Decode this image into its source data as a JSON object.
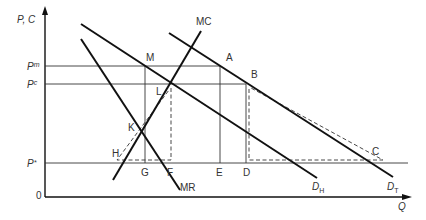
{
  "diagram": {
    "axes": {
      "y_label": "P, C",
      "x_label": "Q",
      "origin": "0"
    },
    "price_levels": [
      {
        "label": "P",
        "sup": "m",
        "id": "pm"
      },
      {
        "label": "P",
        "sup": "c",
        "id": "pc"
      },
      {
        "label": "P",
        "sup": "*",
        "id": "pstar"
      }
    ],
    "curves": {
      "mc": "MC",
      "mr": "MR",
      "d_home": {
        "main": "D",
        "sub": "H"
      },
      "d_total": {
        "main": "D",
        "sub": "T"
      }
    },
    "points": {
      "M": "M",
      "A": "A",
      "B": "B",
      "L": "L",
      "K": "K",
      "H": "H",
      "G": "G",
      "F": "F",
      "E": "E",
      "D": "D",
      "C": "C"
    },
    "colors": {
      "line": "#111111",
      "thin": "#333333",
      "text": "#333333"
    }
  }
}
